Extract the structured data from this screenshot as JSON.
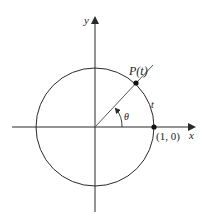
{
  "diagram": {
    "axes": {
      "x_label": "x",
      "y_label": "y"
    },
    "labels": {
      "point_p": "P(t)",
      "arc_length": "t",
      "angle": "θ",
      "point_one_zero": "(1, 0)"
    },
    "colors": {
      "stroke": "#2a2a2a",
      "background": "#ffffff"
    }
  }
}
